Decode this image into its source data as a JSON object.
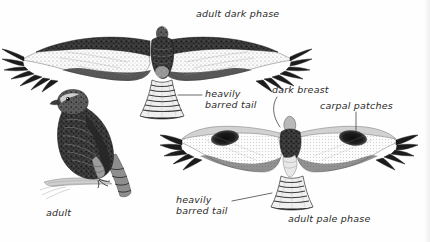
{
  "plate": {
    "title": "Rough-legged Hawk field guide plate",
    "background_color": "#fefefe",
    "ink_color": "#2b2b2b",
    "width": 430,
    "height": 242
  },
  "captions": {
    "adult_dark_phase": "adult dark phase",
    "heavily_barred_tail_1_line1": "heavily",
    "heavily_barred_tail_1_line2": "barred tail",
    "dark_breast": "dark breast",
    "carpal_patches": "carpal patches",
    "heavily_barred_tail_2_line1": "heavily",
    "heavily_barred_tail_2_line2": "barred tail",
    "adult": "adult",
    "adult_pale_phase": "adult pale phase"
  },
  "figures": [
    {
      "id": "dark-phase-flying",
      "label": "adult dark phase",
      "pose": "flying, ventral view, wings fully spread",
      "features": [
        "dark mottled body and wing linings",
        "pale whitish underwing coverts",
        "black primary wingtip fingers",
        "dark trailing edge to wings",
        "fanned tail with heavy dark barring"
      ]
    },
    {
      "id": "perched-adult",
      "label": "adult",
      "pose": "perched on branch, facing left",
      "features": [
        "dark brown streaked upperparts",
        "pale supercilium and face",
        "long barred tail",
        "feathered legs"
      ]
    },
    {
      "id": "pale-phase-flying",
      "label": "adult pale phase",
      "pose": "flying, ventral view, wings spread",
      "features": [
        "whitish underwings",
        "bold black carpal patches at wrist",
        "dark breast band",
        "black wingtips",
        "pale tail with heavy dark barring"
      ]
    }
  ],
  "leader_lines": [
    {
      "name": "leader-heavily-barred-tail-1",
      "style": "horizontal"
    },
    {
      "name": "leader-dark-breast",
      "style": "curved"
    },
    {
      "name": "leader-carpal-patches",
      "style": "vertical"
    },
    {
      "name": "leader-heavily-barred-tail-2",
      "style": "diagonal"
    }
  ]
}
